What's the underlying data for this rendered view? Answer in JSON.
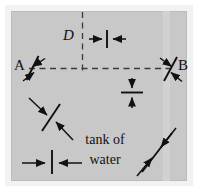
{
  "figure": {
    "kind": "physics-diagram",
    "background_color": "#ffffff",
    "frame_color": "#f2f2f2",
    "tank_fill_color": "#c8c8c8",
    "ink_color": "#111111",
    "dash_color": "#3a3a3a"
  },
  "labels": {
    "point_a": "A",
    "point_b": "B",
    "dimension_d": "D",
    "caption_line_1": "tank of",
    "caption_line_2": "water",
    "caption_full": "tank of water"
  },
  "markers": [
    {
      "name": "marker-a",
      "position": "left-middle",
      "label": "A",
      "style": "crossed-line-with-inward-arrows"
    },
    {
      "name": "marker-b",
      "position": "right-middle",
      "label": "B",
      "style": "crossed-line-with-inward-arrows"
    },
    {
      "name": "marker-lower-left",
      "position": "lower-left",
      "label": "",
      "style": "crossed-line-with-inward-arrows"
    },
    {
      "name": "marker-lower-right",
      "position": "lower-right",
      "label": "",
      "style": "crossed-line-with-inward-arrows"
    },
    {
      "name": "marker-top-center",
      "position": "top-center",
      "label": "",
      "style": "vertical-tick-with-horizontal-inward-arrows"
    },
    {
      "name": "marker-center-right",
      "position": "center-right",
      "label": "",
      "style": "horizontal-tick-with-vertical-inward-arrows"
    },
    {
      "name": "marker-bottom-left",
      "position": "bottom-left",
      "label": "",
      "style": "vertical-tick-with-horizontal-inward-arrows"
    }
  ],
  "guides": [
    {
      "name": "axis-horizontal",
      "orientation": "horizontal",
      "style": "dashed",
      "note": "connects marker A to marker B"
    },
    {
      "name": "axis-vertical",
      "orientation": "vertical",
      "style": "dashed",
      "note": "drops from top edge to the A-B axis, marks distance D"
    }
  ]
}
